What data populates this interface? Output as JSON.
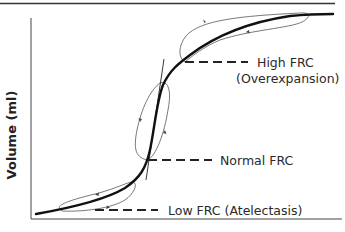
{
  "diagram": {
    "type": "pressure-volume curve",
    "y_axis_label": "Volume (ml)",
    "x_axis_label": "",
    "annotations": [
      {
        "id": "high",
        "line1": "High FRC",
        "line2": "(Overexpansion)"
      },
      {
        "id": "normal",
        "line1": "Normal FRC"
      },
      {
        "id": "low",
        "line1": "Low FRC (Atelectasis)"
      }
    ],
    "colors": {
      "curve": "#111111",
      "loop": "#555555",
      "axis": "#333333",
      "text": "#2a2a2a"
    }
  }
}
